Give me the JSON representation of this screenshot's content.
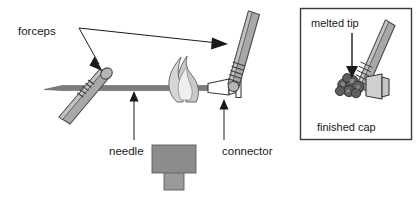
{
  "figure": {
    "title_text": "",
    "background_color": "#ffffff",
    "ink_color": "#1a1a1a",
    "gray_mid": "#8c8c8c",
    "gray_light": "#bfbfbf",
    "gray_dark": "#6e6e6e",
    "flame_fill": "#c9c9c9",
    "flame_inner": "#e8e8e8"
  },
  "labels": {
    "forceps": "forceps",
    "needle": "needle",
    "connector": "connector"
  },
  "inset": {
    "melted_tip": "melted tip",
    "finished_cap": "finished cap"
  },
  "parts": {
    "needle_name": "needle",
    "connector_name": "connector",
    "forceps_left_name": "forceps-left",
    "forceps_right_name": "forceps-right",
    "flame_name": "flame",
    "burner_name": "burner"
  }
}
